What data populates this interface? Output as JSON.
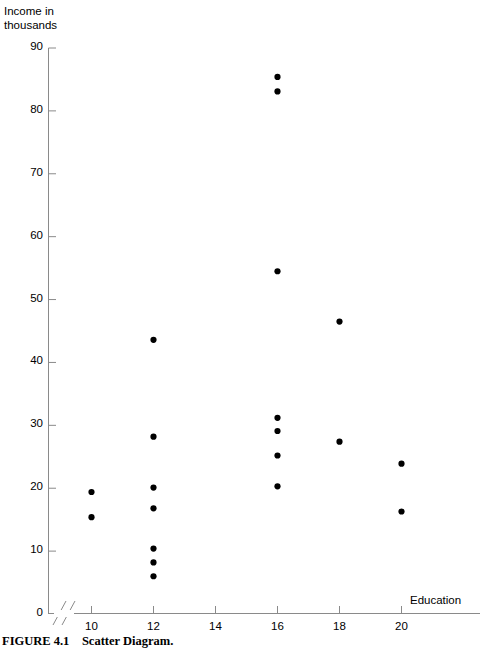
{
  "figure": {
    "caption_label": "FIGURE 4.1",
    "caption_text": "Scatter Diagram."
  },
  "axes": {
    "y_axis_title_line1": "Income in",
    "y_axis_title_line2": "thousands",
    "x_axis_title": "Education",
    "y_ticks": [
      "0",
      "10",
      "20",
      "30",
      "40",
      "50",
      "60",
      "70",
      "80",
      "90"
    ],
    "x_ticks": [
      "10",
      "12",
      "14",
      "16",
      "18",
      "20"
    ],
    "axis_break_symbol": "//"
  },
  "chart_data": {
    "type": "scatter",
    "title": "Scatter Diagram",
    "xlabel": "Education",
    "ylabel": "Income in thousands",
    "xlim": [
      8.6,
      21.4
    ],
    "ylim": [
      0,
      90
    ],
    "x_axis_broken": true,
    "grid": false,
    "legend": "none",
    "marker": "filled-circle",
    "marker_color": "#000000",
    "marker_size_px": 5,
    "xticks": [
      10,
      12,
      14,
      16,
      18,
      20
    ],
    "yticks": [
      0,
      10,
      20,
      30,
      40,
      50,
      60,
      70,
      80,
      90
    ],
    "points": [
      {
        "x": 10,
        "y": 19.4
      },
      {
        "x": 10,
        "y": 15.4
      },
      {
        "x": 12,
        "y": 43.6
      },
      {
        "x": 12,
        "y": 28.2
      },
      {
        "x": 12,
        "y": 20.1
      },
      {
        "x": 12,
        "y": 16.8
      },
      {
        "x": 12,
        "y": 10.4
      },
      {
        "x": 12,
        "y": 8.2
      },
      {
        "x": 12,
        "y": 6.0
      },
      {
        "x": 16,
        "y": 85.4
      },
      {
        "x": 16,
        "y": 83.1
      },
      {
        "x": 16,
        "y": 54.5
      },
      {
        "x": 16,
        "y": 31.2
      },
      {
        "x": 16,
        "y": 29.1
      },
      {
        "x": 16,
        "y": 25.2
      },
      {
        "x": 16,
        "y": 20.3
      },
      {
        "x": 18,
        "y": 46.5
      },
      {
        "x": 18,
        "y": 27.4
      },
      {
        "x": 20,
        "y": 23.9
      },
      {
        "x": 20,
        "y": 16.3
      }
    ]
  }
}
